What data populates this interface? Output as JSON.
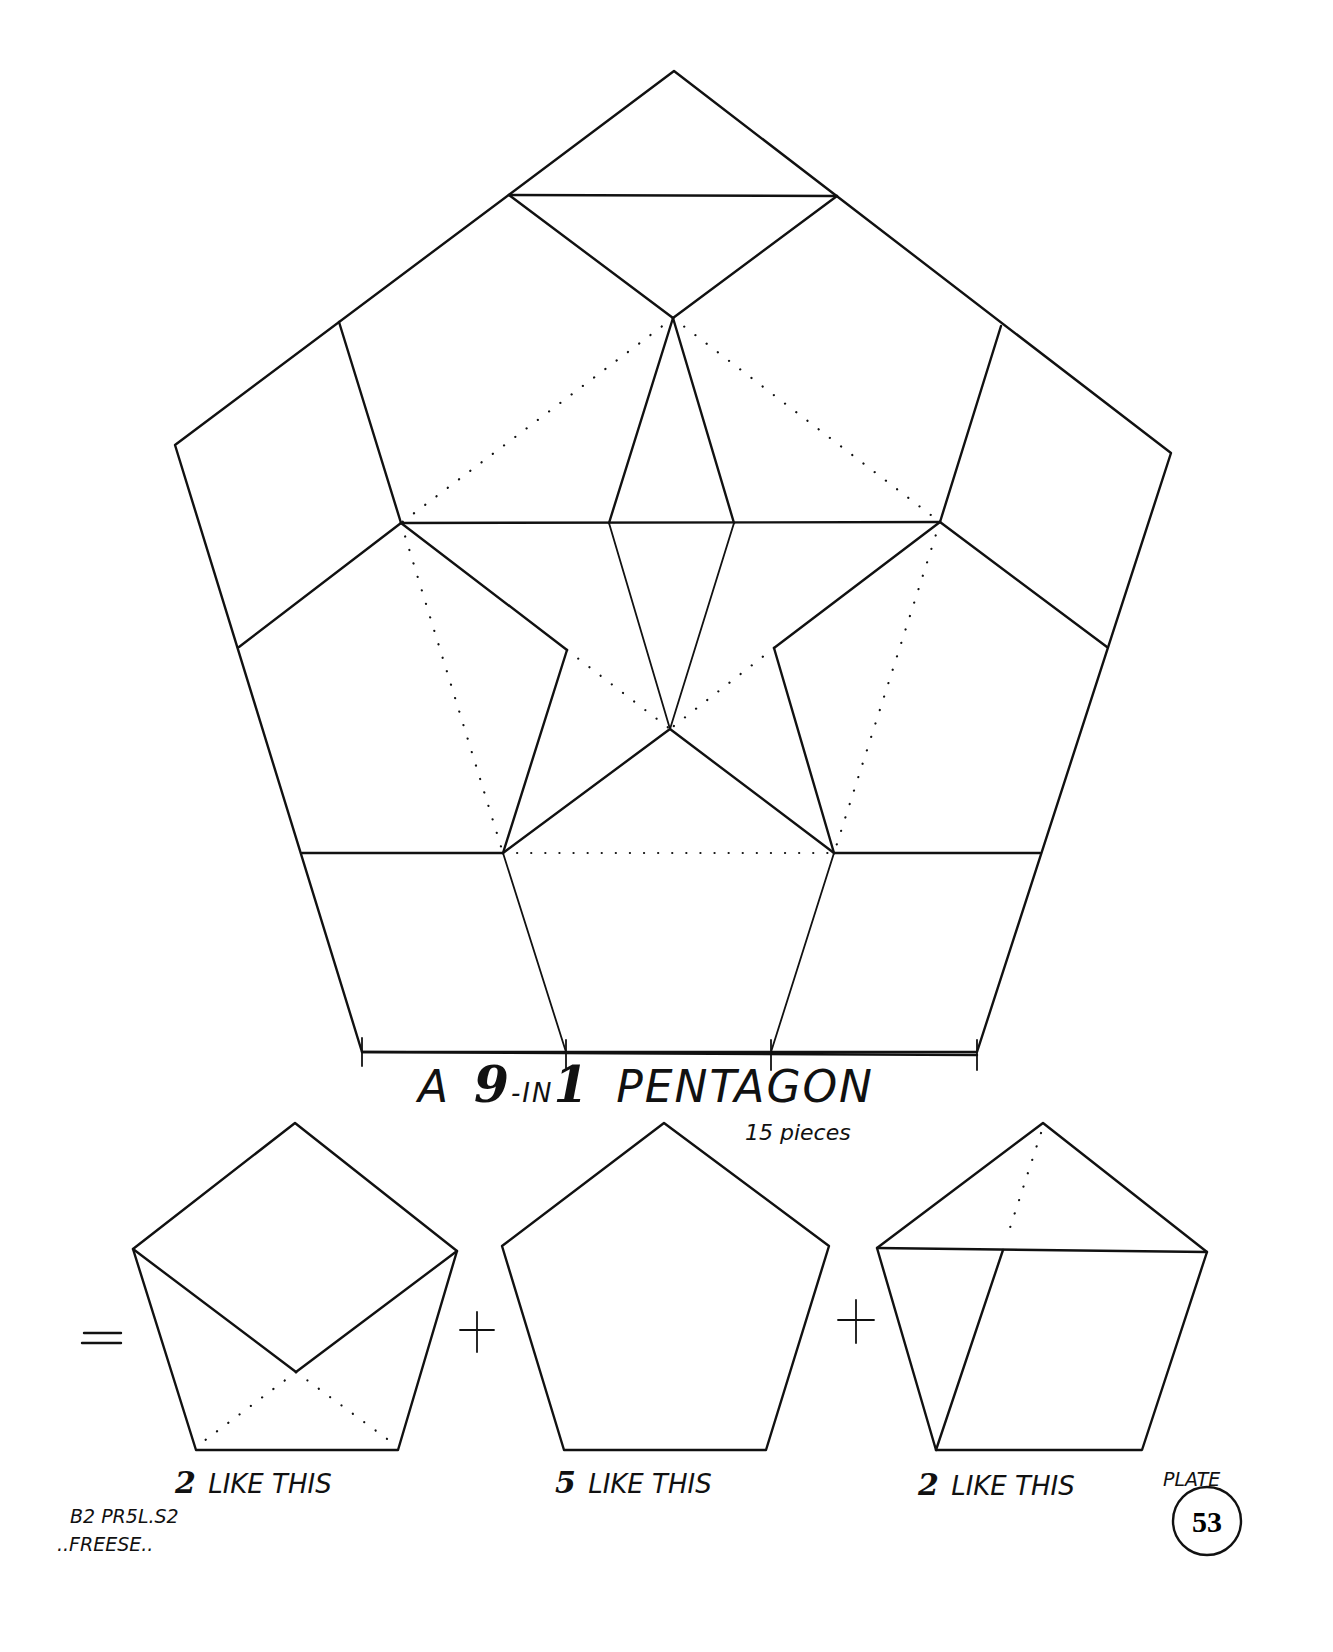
{
  "title": {
    "prefix": "A",
    "big_number_left": "9",
    "middle": "-IN",
    "big_number_right": "1",
    "word": "PENTAGON",
    "subtitle": "15 pieces"
  },
  "equation": {
    "equals": "=",
    "plus": "+"
  },
  "pieces": [
    {
      "count": "2",
      "label": "LIKE THIS"
    },
    {
      "count": "5",
      "label": "LIKE THIS"
    },
    {
      "count": "2",
      "label": "LIKE THIS"
    }
  ],
  "credits": {
    "code": "B2 PR5L.S2",
    "author": "..FREESE.."
  },
  "plate": {
    "label": "PLATE",
    "number": "53"
  }
}
